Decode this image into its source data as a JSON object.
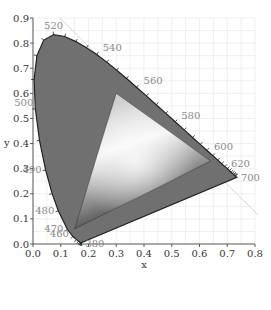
{
  "chart_data": {
    "type": "scatter",
    "title": "",
    "subtitle": "CIE 1931 chromaticity diagram with gamut triangle",
    "xlabel": "x",
    "ylabel": "y",
    "xlim": [
      0.0,
      0.8
    ],
    "ylim": [
      0.0,
      0.9
    ],
    "grid": true,
    "legend": "none",
    "xticks": [
      "0.0",
      "0.1",
      "0.2",
      "0.3",
      "0.4",
      "0.5",
      "0.6",
      "0.7",
      "0.8"
    ],
    "yticks": [
      "0.0",
      "0.1",
      "0.2",
      "0.3",
      "0.4",
      "0.5",
      "0.6",
      "0.7",
      "0.8",
      "0.9"
    ],
    "spectral_locus_labels": [
      {
        "nm": "380",
        "x": 0.1741,
        "y": 0.005
      },
      {
        "nm": "460",
        "x": 0.144,
        "y": 0.0297
      },
      {
        "nm": "470",
        "x": 0.1241,
        "y": 0.0578
      },
      {
        "nm": "480",
        "x": 0.0913,
        "y": 0.1327
      },
      {
        "nm": "490",
        "x": 0.0454,
        "y": 0.295
      },
      {
        "nm": "500",
        "x": 0.0082,
        "y": 0.5384
      },
      {
        "nm": "520",
        "x": 0.0743,
        "y": 0.8338
      },
      {
        "nm": "540",
        "x": 0.2296,
        "y": 0.7543
      },
      {
        "nm": "560",
        "x": 0.3731,
        "y": 0.6245
      },
      {
        "nm": "580",
        "x": 0.5125,
        "y": 0.4866
      },
      {
        "nm": "600",
        "x": 0.627,
        "y": 0.3725
      },
      {
        "nm": "620",
        "x": 0.6915,
        "y": 0.3083
      },
      {
        "nm": "700",
        "x": 0.7347,
        "y": 0.2653
      }
    ],
    "gamut_triangle": {
      "red": {
        "x": 0.64,
        "y": 0.33
      },
      "green": {
        "x": 0.3,
        "y": 0.6
      },
      "blue": {
        "x": 0.15,
        "y": 0.06
      }
    },
    "colors": {
      "locus_fill": "#707070",
      "triangle_light": "#f2f2f2",
      "triangle_dark": "#3a3a3a",
      "grid": "#e6e6e6"
    }
  }
}
